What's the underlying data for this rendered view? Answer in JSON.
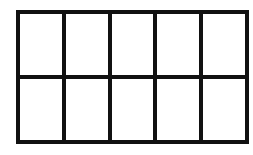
{
  "diagram": {
    "type": "grid",
    "rows": 2,
    "columns": 5,
    "cell_count": 10,
    "colors": {
      "line": "#111111",
      "fill": "#ffffff"
    },
    "cells": [
      {
        "row": 1,
        "col": 1
      },
      {
        "row": 1,
        "col": 2
      },
      {
        "row": 1,
        "col": 3
      },
      {
        "row": 1,
        "col": 4
      },
      {
        "row": 1,
        "col": 5
      },
      {
        "row": 2,
        "col": 1
      },
      {
        "row": 2,
        "col": 2
      },
      {
        "row": 2,
        "col": 3
      },
      {
        "row": 2,
        "col": 4
      },
      {
        "row": 2,
        "col": 5
      }
    ]
  }
}
